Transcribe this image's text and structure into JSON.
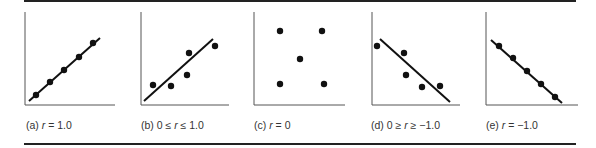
{
  "figure": {
    "panels": [
      {
        "id": "a",
        "label_prefix": "(a) ",
        "label_var": "r",
        "label_suffix": " = 1.0",
        "axes": {
          "x0": 25,
          "y0": 105,
          "ytop": 12,
          "xend": 115
        },
        "line": {
          "x1": 29,
          "y1": 101,
          "x2": 100,
          "y2": 38
        },
        "points": [
          [
            36,
            95
          ],
          [
            50,
            82
          ],
          [
            64,
            70
          ],
          [
            79,
            57
          ],
          [
            93,
            43
          ]
        ],
        "caption_x": 26
      },
      {
        "id": "b",
        "label_prefix": "(b) 0 ≤ ",
        "label_var": "r",
        "label_suffix": " ≤ 1.0",
        "axes": {
          "x0": 141,
          "y0": 105,
          "ytop": 12,
          "xend": 229
        },
        "line": {
          "x1": 144,
          "y1": 101,
          "x2": 213,
          "y2": 39
        },
        "points": [
          [
            153,
            85
          ],
          [
            171,
            86
          ],
          [
            187,
            75
          ],
          [
            189,
            53
          ],
          [
            215,
            46
          ]
        ],
        "caption_x": 141
      },
      {
        "id": "c",
        "label_prefix": "(c) ",
        "label_var": "r",
        "label_suffix": " = 0",
        "axes": {
          "x0": 254,
          "y0": 105,
          "ytop": 12,
          "xend": 345
        },
        "line": null,
        "points": [
          [
            280,
            31
          ],
          [
            322,
            31
          ],
          [
            300,
            59
          ],
          [
            280,
            84
          ],
          [
            324,
            84
          ]
        ],
        "caption_x": 254
      },
      {
        "id": "d",
        "label_prefix": "(d) 0 ≥ ",
        "label_var": "r",
        "label_suffix": " ≥ −1.0",
        "axes": {
          "x0": 372,
          "y0": 105,
          "ytop": 12,
          "xend": 460
        },
        "line": {
          "x1": 380,
          "y1": 39,
          "x2": 450,
          "y2": 102
        },
        "points": [
          [
            377,
            46
          ],
          [
            404,
            53
          ],
          [
            406,
            75
          ],
          [
            422,
            87
          ],
          [
            440,
            86
          ]
        ],
        "caption_x": 371
      },
      {
        "id": "e",
        "label_prefix": "(e) ",
        "label_var": "r",
        "label_suffix": " = −1.0",
        "axes": {
          "x0": 486,
          "y0": 105,
          "ytop": 12,
          "xend": 578
        },
        "line": {
          "x1": 491,
          "y1": 40,
          "x2": 562,
          "y2": 103
        },
        "points": [
          [
            499,
            46
          ],
          [
            513,
            58
          ],
          [
            527,
            71
          ],
          [
            541,
            84
          ],
          [
            555,
            97
          ]
        ],
        "caption_x": 486
      }
    ],
    "colors": {
      "ink": "#111111",
      "axis": "#555555",
      "rule": "#222222"
    }
  }
}
